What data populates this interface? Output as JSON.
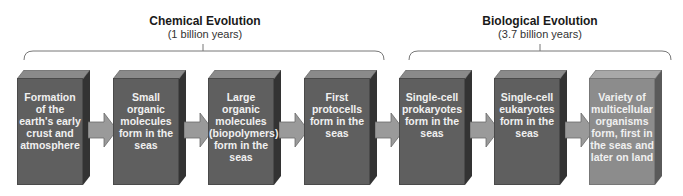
{
  "groups": [
    {
      "title": "Chemical Evolution",
      "subtitle": "(1 billion years)"
    },
    {
      "title": "Biological Evolution",
      "subtitle": "(3.7 billion years)"
    }
  ],
  "steps": [
    {
      "label": "Formation of the earth's early crust and atmosphere"
    },
    {
      "label": "Small organic molecules form in the seas"
    },
    {
      "label": "Large organic molecules (biopolymers) form in the seas"
    },
    {
      "label": "First protocells form in the seas"
    },
    {
      "label": "Single-cell prokaryotes form in the seas"
    },
    {
      "label": "Single-cell eukaryotes form in the seas"
    },
    {
      "label": "Variety of multicellular organisms form, first in the seas and later on land"
    }
  ],
  "colors": {
    "box_dark": "#5f5f5f",
    "box_light": "#8c8c8c",
    "arrow": "#9a9a9a"
  }
}
